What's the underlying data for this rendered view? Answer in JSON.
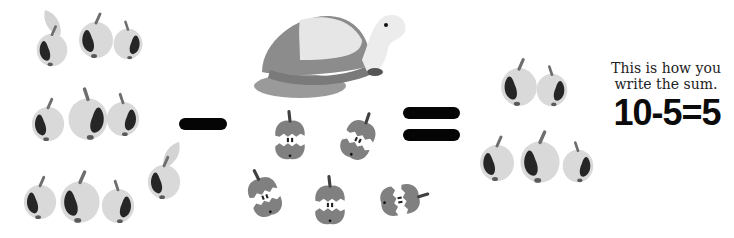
{
  "scene": {
    "title": "Subtraction illustration",
    "caption_lines": [
      "This is how you",
      "write the sum."
    ],
    "equation": "10-5=5",
    "start_count": 10,
    "taken_away_count": 5,
    "result_count": 5,
    "operator_minus": "minus",
    "operator_equals": "equals",
    "colors": {
      "apple_body": "#d9d9d9",
      "apple_shadow": "#262626",
      "stem": "#6e6e6e",
      "leaf": "#d4d4d4",
      "core_skin": "#808080",
      "operator": "#050505",
      "turtle_shell_dark": "#8c8c8c",
      "turtle_shell_light": "#e6e6e6"
    }
  },
  "groups": {
    "left_apples_label": "10 apples",
    "cores_label": "5 eaten apple cores",
    "turtle_label": "toy turtle",
    "right_apples_label": "5 apples"
  }
}
